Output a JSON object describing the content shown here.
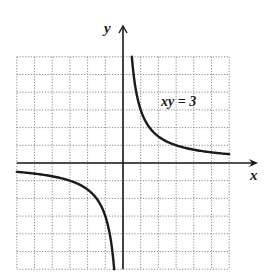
{
  "chart_data": {
    "type": "line",
    "title": "",
    "equation": "xy = 3",
    "xlabel": "x",
    "ylabel": "y",
    "xlim": [
      -6,
      6
    ],
    "ylim": [
      -6,
      6
    ],
    "grid": true,
    "grid_style": "dotted",
    "grid_step": 1,
    "legend": null,
    "annotations": [
      {
        "text": "xy = 3",
        "x": 3.2,
        "y": 3.5
      }
    ],
    "series": [
      {
        "name": "xy = 3 (first quadrant branch)",
        "x": [
          0.5,
          0.75,
          1,
          1.5,
          2,
          3,
          4,
          5,
          6
        ],
        "y": [
          6,
          4,
          3,
          2,
          1.5,
          1,
          0.75,
          0.6,
          0.5
        ]
      },
      {
        "name": "xy = 3 (third quadrant branch)",
        "x": [
          -6,
          -5,
          -4,
          -3,
          -2,
          -1.5,
          -1,
          -0.75,
          -0.5
        ],
        "y": [
          -0.5,
          -0.6,
          -0.75,
          -1,
          -1.5,
          -2,
          -3,
          -4,
          -6
        ]
      }
    ]
  },
  "labels": {
    "x_axis": "x",
    "y_axis": "y",
    "curve": "xy = 3"
  },
  "colors": {
    "curve": "#1a1a1a",
    "axis": "#1a1a1a",
    "grid": "#8a8a8a",
    "background": "#ffffff"
  }
}
